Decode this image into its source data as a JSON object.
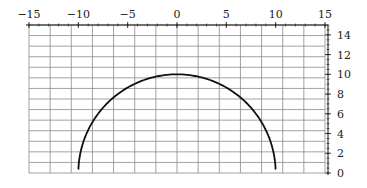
{
  "chart_data": {
    "type": "line",
    "title": "",
    "xlabel": "",
    "ylabel": "",
    "xlim": [
      -15,
      15
    ],
    "ylim": [
      0,
      15
    ],
    "x_axis_position": "top",
    "y_axis_position": "right",
    "grid": true,
    "grid_columns": 14,
    "grid_rows": 14,
    "x_ticks": [
      {
        "value": -15,
        "label": "−15"
      },
      {
        "value": -10,
        "label": "−10"
      },
      {
        "value": -5,
        "label": "−5"
      },
      {
        "value": 0,
        "label": "0"
      },
      {
        "value": 5,
        "label": "5"
      },
      {
        "value": 10,
        "label": "10"
      },
      {
        "value": 15,
        "label": "15"
      }
    ],
    "y_ticks": [
      {
        "value": 0,
        "label": "0"
      },
      {
        "value": 2,
        "label": "2"
      },
      {
        "value": 4,
        "label": "4"
      },
      {
        "value": 6,
        "label": "6"
      },
      {
        "value": 8,
        "label": "8"
      },
      {
        "value": 10,
        "label": "10"
      },
      {
        "value": 12,
        "label": "12"
      },
      {
        "value": 14,
        "label": "14"
      }
    ],
    "x_minor_step": 1,
    "y_minor_step": 0.5,
    "series": [
      {
        "name": "semicircle",
        "description": "upper semicircle y = sqrt(100 - x^2)",
        "center": [
          0,
          0
        ],
        "radius": 10,
        "x_range": [
          -10,
          10
        ],
        "color": "#111111"
      }
    ]
  }
}
